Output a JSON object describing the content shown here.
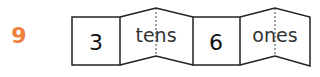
{
  "problem": {
    "number": "9",
    "number_color": "#f07f3c"
  },
  "place_value": {
    "tens_digit": "3",
    "tens_label": "tens",
    "ones_digit": "6",
    "ones_label": "ones"
  }
}
